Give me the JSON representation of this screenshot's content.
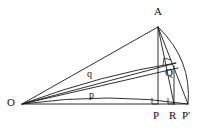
{
  "figure": {
    "kind": "geometry-diagram",
    "width": 203,
    "height": 128,
    "background_color": "#ffffff",
    "stroke_color": "#1a1a1a",
    "labels": {
      "apex": "A",
      "origin": "O",
      "foot": "P",
      "mid": "R",
      "foot_prime": "P′",
      "interior": "Q",
      "segment_p": "p",
      "segment_q": "q"
    },
    "points": {
      "A": {
        "x": 158,
        "y": 27
      },
      "O": {
        "x": 22,
        "y": 104
      },
      "P": {
        "x": 158,
        "y": 104
      },
      "R": {
        "x": 174,
        "y": 104
      },
      "Pprime": {
        "x": 188,
        "y": 104
      },
      "Q": {
        "x": 170,
        "y": 71
      },
      "T": {
        "x": 172,
        "y": 65
      }
    },
    "label_positions": {
      "A": {
        "x": 154,
        "y": 7
      },
      "O": {
        "x": 8,
        "y": 97
      },
      "P": {
        "x": 154,
        "y": 110
      },
      "R": {
        "x": 169,
        "y": 110
      },
      "Pprime": {
        "x": 183,
        "y": 110
      },
      "Q": {
        "x": 166,
        "y": 68
      },
      "p": {
        "x": 90,
        "y": 91
      },
      "q": {
        "x": 88,
        "y": 71
      }
    },
    "right_angles": [
      {
        "name": "right-angle-at-P",
        "x": 152,
        "y": 98
      },
      {
        "name": "right-angle-at-R",
        "x": 168,
        "y": 98
      },
      {
        "name": "right-angle-at-Q",
        "x": 163,
        "y": 59
      }
    ],
    "segments": [
      {
        "name": "O-to-A",
        "from": "O",
        "to": "A"
      },
      {
        "name": "O-to-T",
        "from": "O",
        "to": "T"
      },
      {
        "name": "O-to-Q",
        "from": "O",
        "to": "Q"
      },
      {
        "name": "O-to-Pprime",
        "from": "O",
        "to": "Pprime"
      },
      {
        "name": "A-to-P",
        "from": "A",
        "to": "P"
      },
      {
        "name": "A-to-R",
        "from": "A",
        "to": "R"
      },
      {
        "name": "A-to-Pprime",
        "from": "A",
        "to": "Pprime"
      },
      {
        "name": "R-to-baseline",
        "from": "R",
        "to": "Pprime"
      }
    ],
    "arcs": [
      {
        "name": "arc-A-to-Pprime",
        "from": "A",
        "to": "Pprime"
      },
      {
        "name": "arc-p-curve",
        "from": "O",
        "to": "Pprime"
      },
      {
        "name": "arc-q-curve",
        "from": "O",
        "to": "T"
      }
    ]
  }
}
